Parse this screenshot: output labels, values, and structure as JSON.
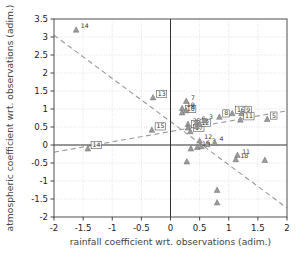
{
  "chart_data": {
    "type": "scatter",
    "title": "",
    "xlabel": "rainfall coefficient wrt. observations (adim.)",
    "ylabel": "atmospheric coefficient wrt. observations (adim.)",
    "xlim": [
      -2,
      2
    ],
    "ylim": [
      -2,
      3.5
    ],
    "xticks": [
      "-2",
      "-1.5",
      "-1",
      "-0.5",
      "0",
      "0.5",
      "1",
      "1.5",
      "2"
    ],
    "xtick_values": [
      -2,
      -1.5,
      -1,
      -0.5,
      0,
      0.5,
      1,
      1.5,
      2
    ],
    "yticks": [
      "3.5",
      "3",
      "2.5",
      "2",
      "1.5",
      "1",
      "0.5",
      "0",
      "-0.5",
      "-1",
      "-1.5",
      "-2"
    ],
    "ytick_values": [
      3.5,
      3,
      2.5,
      2,
      1.5,
      1,
      0.5,
      0,
      -0.5,
      -1,
      -1.5,
      -2
    ],
    "grid": "dotted",
    "legend": "none",
    "marker": "triangle",
    "marker_color": "#8c8c8c",
    "label_box_color": "#555555",
    "trend_color": "#999999",
    "points": [
      {
        "label": "14",
        "x": -1.62,
        "y": 3.2,
        "boxed": false
      },
      {
        "label": "13",
        "x": -0.3,
        "y": 1.32,
        "boxed": true
      },
      {
        "label": "15",
        "x": -0.32,
        "y": 0.42,
        "boxed": true
      },
      {
        "label": "14",
        "x": -1.42,
        "y": -0.1,
        "boxed": true
      },
      {
        "label": "10",
        "x": 0.2,
        "y": 0.9,
        "boxed": true
      },
      {
        "label": "10",
        "x": 0.2,
        "y": 1.02,
        "boxed": false
      },
      {
        "label": "8",
        "x": 0.27,
        "y": 0.96,
        "boxed": false
      },
      {
        "label": "7",
        "x": 0.27,
        "y": 1.22,
        "boxed": false
      },
      {
        "label": "25",
        "x": 0.3,
        "y": 0.58,
        "boxed": false
      },
      {
        "label": "2",
        "x": 0.3,
        "y": 0.48,
        "boxed": true
      },
      {
        "label": "17",
        "x": 0.34,
        "y": 0.38,
        "boxed": true
      },
      {
        "label": "6",
        "x": 0.45,
        "y": 0.62,
        "boxed": false
      },
      {
        "label": "12",
        "x": 0.45,
        "y": 0.52,
        "boxed": true
      },
      {
        "label": "2",
        "x": 0.5,
        "y": 0.58,
        "boxed": false
      },
      {
        "label": "3",
        "x": 0.58,
        "y": 0.68,
        "boxed": false
      },
      {
        "label": "8",
        "x": 0.84,
        "y": 0.78,
        "boxed": true
      },
      {
        "label": "16",
        "x": 1.06,
        "y": 0.88,
        "boxed": true
      },
      {
        "label": "9",
        "x": 1.22,
        "y": 0.88,
        "boxed": true
      },
      {
        "label": "11",
        "x": 1.2,
        "y": 0.7,
        "boxed": true
      },
      {
        "label": "5",
        "x": 1.66,
        "y": 0.72,
        "boxed": true
      },
      {
        "label": "12",
        "x": 0.5,
        "y": 0.12,
        "boxed": false
      },
      {
        "label": "19",
        "x": 0.46,
        "y": -0.06,
        "boxed": false
      },
      {
        "label": "6",
        "x": 0.53,
        "y": -0.04,
        "boxed": false
      },
      {
        "label": "3",
        "x": 0.63,
        "y": 0.02,
        "boxed": false
      },
      {
        "label": "4",
        "x": 0.76,
        "y": 0.06,
        "boxed": false
      },
      {
        "label": "11",
        "x": 1.15,
        "y": -0.28,
        "boxed": false
      },
      {
        "label": "18",
        "x": 1.12,
        "y": -0.4,
        "boxed": false
      },
      {
        "label": "",
        "x": 0.35,
        "y": -0.1,
        "boxed": false
      },
      {
        "label": "",
        "x": 0.28,
        "y": -0.46,
        "boxed": false
      },
      {
        "label": "",
        "x": 1.62,
        "y": -0.42,
        "boxed": false
      },
      {
        "label": "",
        "x": 0.8,
        "y": -1.25,
        "boxed": false
      },
      {
        "label": "",
        "x": 0.8,
        "y": -1.6,
        "boxed": false
      }
    ],
    "trend_lines": [
      {
        "name": "descending",
        "x1": -2.0,
        "y1": 3.05,
        "x2": 2.0,
        "y2": -1.75
      },
      {
        "name": "ascending",
        "x1": -2.0,
        "y1": -0.2,
        "x2": 2.0,
        "y2": 0.95
      }
    ]
  }
}
